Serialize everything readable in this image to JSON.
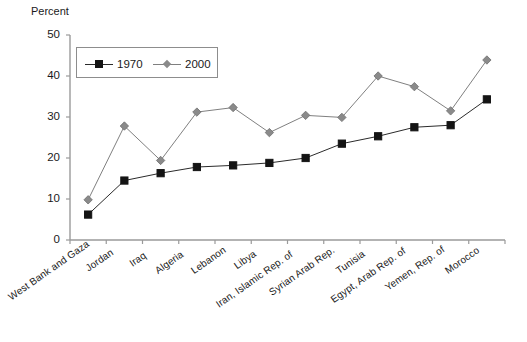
{
  "chart_data": {
    "type": "line",
    "title": "",
    "subtitle": "",
    "ylabel": "Percent",
    "xlabel": "",
    "ylim": [
      0,
      50
    ],
    "yticks": [
      0,
      10,
      20,
      30,
      40,
      50
    ],
    "grid": false,
    "legend_position": "top-left",
    "categories": [
      "West Bank and Gaza",
      "Jordan",
      "Iraq",
      "Algeria",
      "Lebanon",
      "Libya",
      "Iran, Islamic Rep. of",
      "Syrian Arab Rep.",
      "Tunisia",
      "Egypt, Arab Rep. of",
      "Yemen, Rep. of",
      "Morocco"
    ],
    "series": [
      {
        "name": "1970",
        "marker": "square",
        "color": "#141414",
        "values": [
          6.2,
          14.5,
          16.3,
          17.8,
          18.2,
          18.8,
          20.0,
          23.5,
          25.3,
          27.5,
          28.0,
          34.3
        ]
      },
      {
        "name": "2000",
        "marker": "diamond",
        "color": "#8a8a8a",
        "values": [
          9.8,
          27.8,
          19.4,
          31.2,
          32.3,
          26.2,
          30.4,
          29.9,
          40.0,
          37.4,
          31.5,
          43.9
        ]
      }
    ]
  },
  "axis": {
    "y_title": "Percent",
    "y_tick_labels": [
      "0",
      "10",
      "20",
      "30",
      "40",
      "50"
    ]
  },
  "legend": {
    "items": [
      {
        "label": "1970"
      },
      {
        "label": "2000"
      }
    ]
  }
}
